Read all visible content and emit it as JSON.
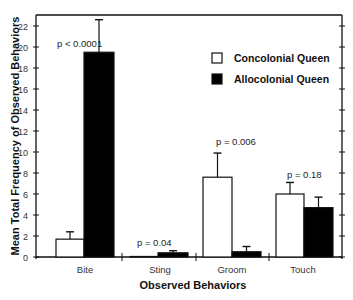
{
  "chart_data": {
    "type": "bar",
    "title": "",
    "xlabel": "Observed Behaviors",
    "ylabel": "Mean Total Frequency of Observed Behaviors",
    "categories": [
      "Bite",
      "Sting",
      "Groom",
      "Touch"
    ],
    "series": [
      {
        "name": "Concolonial Queen",
        "color": "#ffffff",
        "values": [
          1.7,
          0.05,
          7.6,
          6.0
        ],
        "error_upper": [
          2.4,
          0.05,
          9.9,
          7.1
        ]
      },
      {
        "name": "Allocolonial Queen",
        "color": "#000000",
        "values": [
          19.5,
          0.4,
          0.5,
          4.7
        ],
        "error_upper": [
          22.6,
          0.6,
          1.0,
          5.7
        ]
      }
    ],
    "annotations": [
      {
        "category": "Bite",
        "text": "p < 0.0001"
      },
      {
        "category": "Sting",
        "text": "p = 0.04"
      },
      {
        "category": "Groom",
        "text": "p = 0.006"
      },
      {
        "category": "Touch",
        "text": "p = 0.18"
      }
    ],
    "yticks": [
      0,
      2,
      4,
      6,
      8,
      10,
      12,
      14,
      16,
      18,
      20,
      22
    ],
    "ylim": [
      0,
      23
    ],
    "grid": false,
    "legend_position": "upper right"
  }
}
